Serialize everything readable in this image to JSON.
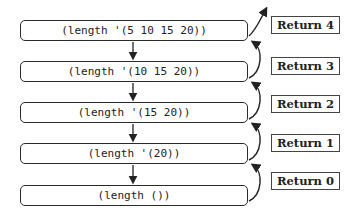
{
  "calls": [
    {
      "label": "(length '(5 10 15 20))"
    },
    {
      "label": "(length '(10 15 20))"
    },
    {
      "label": "(length '(15 20))"
    },
    {
      "label": "(length '(20))"
    },
    {
      "label": "(length ())"
    }
  ],
  "returns": [
    {
      "label": "Return 4"
    },
    {
      "label": "Return 3"
    },
    {
      "label": "Return 2"
    },
    {
      "label": "Return 1"
    },
    {
      "label": "Return 0"
    }
  ],
  "colors": {
    "stroke": "#2a2a2a",
    "background": "#ffffff"
  }
}
